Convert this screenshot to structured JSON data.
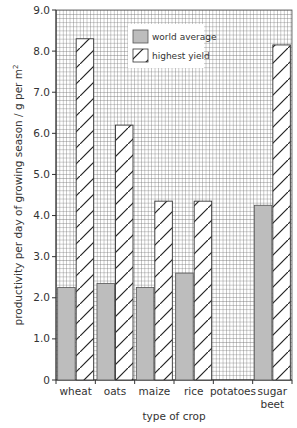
{
  "chart_data": {
    "type": "bar",
    "title": "",
    "xlabel": "type of crop",
    "ylabel": "productivity per day of growing season / g per m²",
    "ylabel_main": "productivity per day of growing season / g per m",
    "ylabel_sup": "2",
    "ylim": [
      0,
      9.0
    ],
    "yticks": [
      "0",
      "1.0",
      "2.0",
      "3.0",
      "4.0",
      "5.0",
      "6.0",
      "7.0",
      "8.0",
      "9.0"
    ],
    "grid": true,
    "legend_position": "upper center",
    "categories": [
      "wheat",
      "oats",
      "maize",
      "rice",
      "potatoes",
      "sugar beet"
    ],
    "category_lines": [
      [
        "wheat"
      ],
      [
        "oats"
      ],
      [
        "maize"
      ],
      [
        "rice"
      ],
      [
        "potatoes"
      ],
      [
        "sugar",
        "beet"
      ]
    ],
    "series": [
      {
        "name": "world average",
        "pattern": "solid-grey",
        "color": "#bdbdbd",
        "values": [
          2.25,
          2.35,
          2.25,
          2.6,
          null,
          4.25
        ]
      },
      {
        "name": "highest yield",
        "pattern": "diagonal-hatch",
        "color": "#ffffff",
        "values": [
          8.3,
          6.2,
          4.35,
          4.35,
          null,
          8.15
        ]
      }
    ]
  },
  "colors": {
    "grid": "#555555",
    "axis": "#333333",
    "bar_average": "#bdbdbd",
    "bar_outline": "#444444",
    "background": "#ffffff"
  }
}
